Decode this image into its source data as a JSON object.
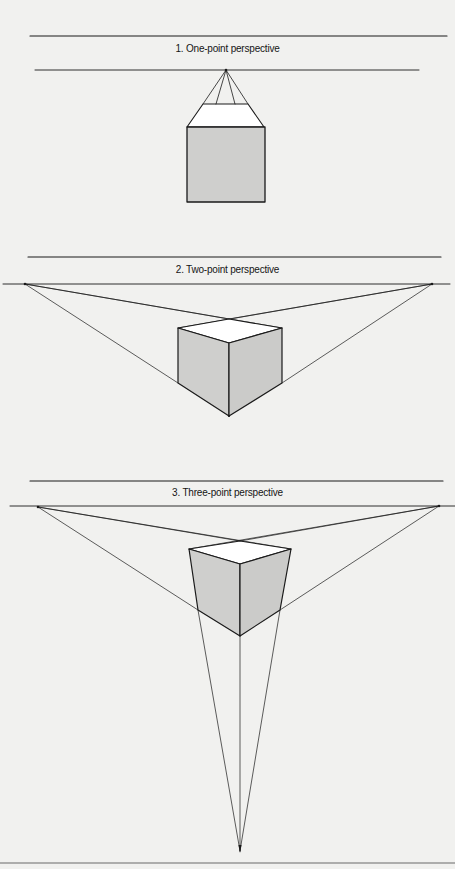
{
  "sections": [
    {
      "title": "1. One-point perspective",
      "type": "one-point",
      "vanishing_points": 1
    },
    {
      "title": "2. Two-point perspective",
      "type": "two-point",
      "vanishing_points": 2
    },
    {
      "title": "3. Three-point perspective",
      "type": "three-point",
      "vanishing_points": 3
    }
  ],
  "colors": {
    "background": "#f1f1ef",
    "line": "#1a1a1a",
    "face_shade": "#cfcfcd",
    "face_light": "#ffffff"
  }
}
